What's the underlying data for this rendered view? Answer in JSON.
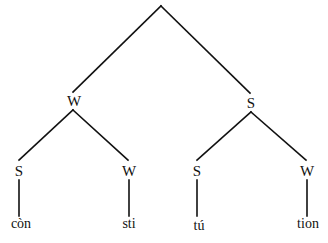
{
  "diagram": {
    "type": "metrical-stress-tree",
    "root": {
      "label": "",
      "children": [
        {
          "label": "W",
          "children": [
            {
              "label": "S",
              "leaf": "còn"
            },
            {
              "label": "W",
              "leaf": "sti"
            }
          ]
        },
        {
          "label": "S",
          "children": [
            {
              "label": "S",
              "leaf": "tú"
            },
            {
              "label": "W",
              "leaf": "tion"
            }
          ]
        }
      ]
    },
    "colors": {
      "line": "#111111",
      "text": "#111111",
      "background": "#ffffff"
    }
  },
  "labels": {
    "level1": [
      "W",
      "S"
    ],
    "level2": [
      "S",
      "W",
      "S",
      "W"
    ],
    "leaves": [
      "còn",
      "sti",
      "tú",
      "tion"
    ]
  }
}
